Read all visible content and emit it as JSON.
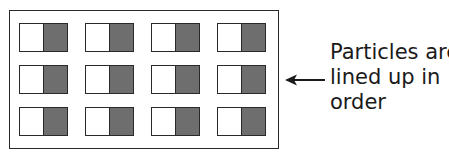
{
  "diagram": {
    "container": {
      "rows": 3,
      "columns": 4
    },
    "particle": {
      "light_color": "#ffffff",
      "dark_color": "#6e6e6e"
    },
    "arrow": {
      "direction": "left",
      "icon": "arrow-left-icon"
    },
    "label": {
      "lines": [
        "Particles are",
        "lined up in",
        "order"
      ]
    }
  }
}
